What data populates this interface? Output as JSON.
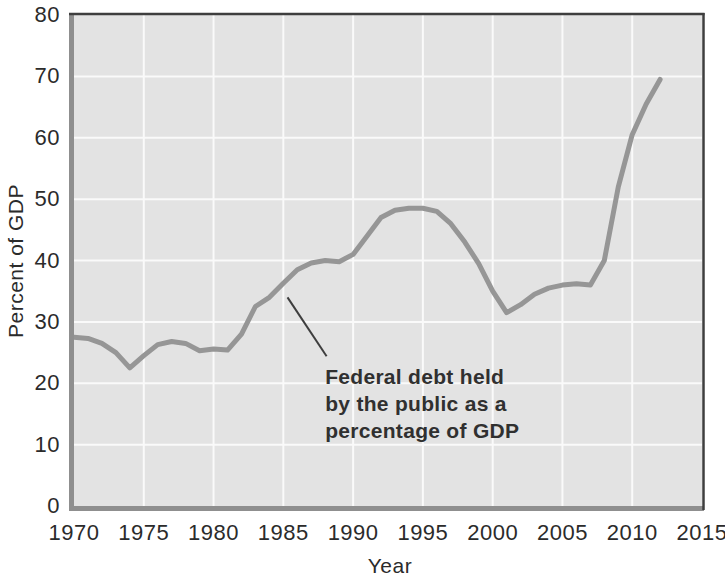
{
  "chart_data": {
    "type": "line",
    "title": "",
    "xlabel": "Year",
    "ylabel": "Percent of GDP",
    "xlim": [
      1970,
      2015
    ],
    "ylim": [
      0,
      80
    ],
    "x_ticks": [
      1970,
      1975,
      1980,
      1985,
      1990,
      1995,
      2000,
      2005,
      2010,
      2015
    ],
    "y_ticks": [
      0,
      10,
      20,
      30,
      40,
      50,
      60,
      70,
      80
    ],
    "grid": true,
    "legend_position": "none",
    "series": [
      {
        "name": "Federal debt held by the public as a percentage of GDP",
        "points": [
          [
            1970,
            27.5
          ],
          [
            1971,
            27.3
          ],
          [
            1972,
            26.5
          ],
          [
            1973,
            25.0
          ],
          [
            1974,
            22.5
          ],
          [
            1975,
            24.5
          ],
          [
            1976,
            26.3
          ],
          [
            1977,
            26.8
          ],
          [
            1978,
            26.5
          ],
          [
            1979,
            25.3
          ],
          [
            1980,
            25.6
          ],
          [
            1981,
            25.4
          ],
          [
            1982,
            28.0
          ],
          [
            1983,
            32.5
          ],
          [
            1984,
            34.0
          ],
          [
            1985,
            36.3
          ],
          [
            1986,
            38.5
          ],
          [
            1987,
            39.6
          ],
          [
            1988,
            40.0
          ],
          [
            1989,
            39.8
          ],
          [
            1990,
            41.0
          ],
          [
            1991,
            44.0
          ],
          [
            1992,
            47.0
          ],
          [
            1993,
            48.2
          ],
          [
            1994,
            48.5
          ],
          [
            1995,
            48.5
          ],
          [
            1996,
            48.0
          ],
          [
            1997,
            46.0
          ],
          [
            1998,
            43.0
          ],
          [
            1999,
            39.5
          ],
          [
            2000,
            35.0
          ],
          [
            2001,
            31.5
          ],
          [
            2002,
            32.8
          ],
          [
            2003,
            34.5
          ],
          [
            2004,
            35.5
          ],
          [
            2005,
            36.0
          ],
          [
            2006,
            36.2
          ],
          [
            2007,
            36.0
          ],
          [
            2008,
            40.0
          ],
          [
            2009,
            52.0
          ],
          [
            2010,
            60.5
          ],
          [
            2011,
            65.5
          ],
          [
            2012,
            69.5
          ]
        ]
      }
    ],
    "annotation": {
      "lines": [
        "Federal debt held",
        "by the public as a",
        "percentage of GDP"
      ],
      "pointer_from": [
        1985.3,
        34.0
      ],
      "pointer_to": [
        1988.1,
        24.4
      ],
      "text_anchor": [
        1988.0,
        23.3
      ]
    },
    "colors": {
      "plot_bg": "#e3e3e3",
      "gridline": "#fafafa",
      "line": "#969696",
      "axis_gray": "#8f8f8f",
      "border_dark": "#3e3e3e",
      "text": "#2b2b2b",
      "annotation_text": "#303030"
    }
  }
}
